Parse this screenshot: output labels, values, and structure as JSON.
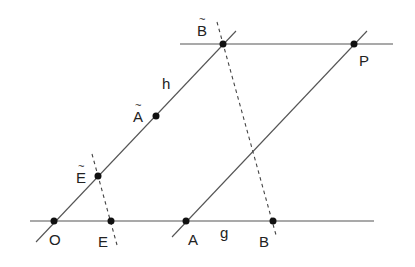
{
  "diagram": {
    "lines": [
      {
        "name": "line-g",
        "x1": 30,
        "y1": 221,
        "x2": 374,
        "y2": 221,
        "style": "solid"
      },
      {
        "name": "line-top-parallel",
        "x1": 180,
        "y1": 44,
        "x2": 393,
        "y2": 44,
        "style": "solid"
      },
      {
        "name": "line-h",
        "x1": 36,
        "y1": 242,
        "x2": 236,
        "y2": 31,
        "style": "solid"
      },
      {
        "name": "line-ap",
        "x1": 172,
        "y1": 237,
        "x2": 367,
        "y2": 31,
        "style": "solid"
      },
      {
        "name": "dashed-btilde-b",
        "x1": 217,
        "y1": 22,
        "x2": 276,
        "y2": 235,
        "style": "dashed"
      },
      {
        "name": "dashed-etilde-e",
        "x1": 92,
        "y1": 154,
        "x2": 117,
        "y2": 245,
        "style": "dashed"
      }
    ],
    "points": [
      {
        "name": "point-o",
        "x": 54,
        "y": 221
      },
      {
        "name": "point-e",
        "x": 111,
        "y": 221
      },
      {
        "name": "point-a",
        "x": 186,
        "y": 221
      },
      {
        "name": "point-b",
        "x": 273,
        "y": 221
      },
      {
        "name": "point-btilde",
        "x": 223,
        "y": 44
      },
      {
        "name": "point-p",
        "x": 354,
        "y": 44
      },
      {
        "name": "point-etilde",
        "x": 98,
        "y": 176
      },
      {
        "name": "point-atilde",
        "x": 156,
        "y": 116
      }
    ],
    "labels": {
      "O": "O",
      "E": "E",
      "A": "A",
      "g": "g",
      "B": "B",
      "B_tilde_base": "B",
      "P": "P",
      "h": "h",
      "A_tilde_base": "A",
      "E_tilde_base": "E",
      "tilde": "~"
    }
  }
}
